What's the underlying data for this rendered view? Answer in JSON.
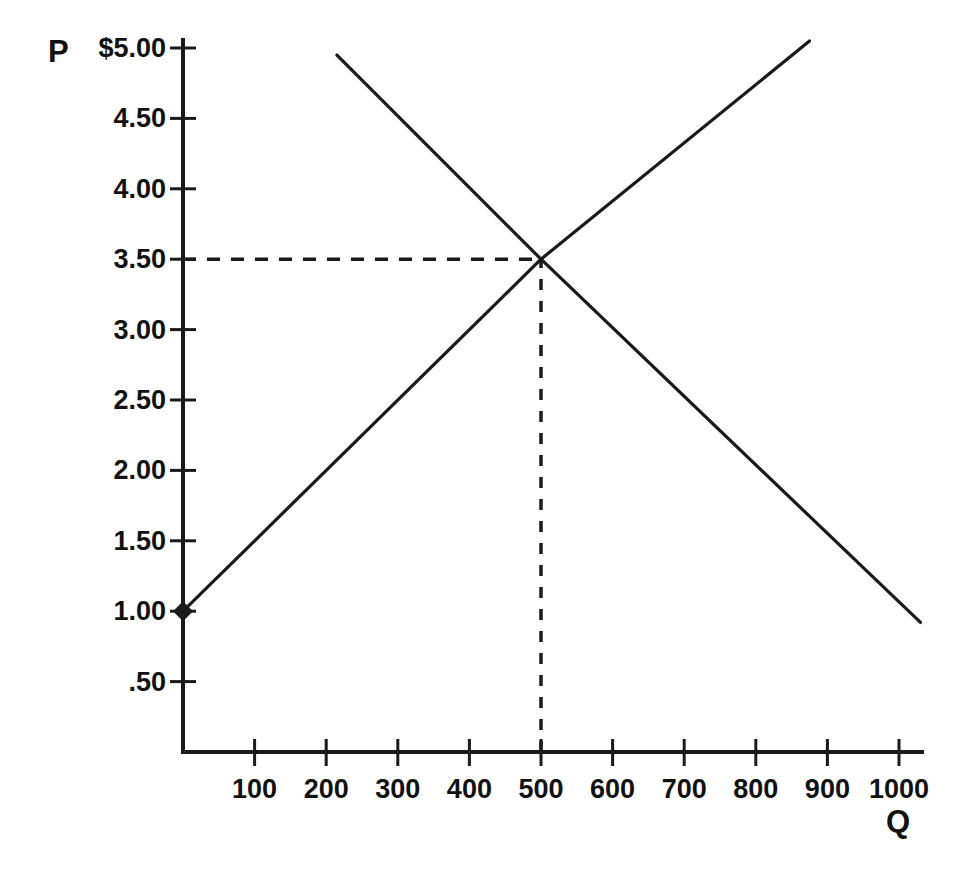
{
  "chart_data": {
    "type": "line",
    "title": "",
    "subtitle": "",
    "xlabel": "Q",
    "ylabel": "P",
    "xlim": [
      0,
      1030
    ],
    "ylim": [
      0,
      5.15
    ],
    "grid": false,
    "legend": "none",
    "x_tick_values": [
      100,
      200,
      300,
      400,
      500,
      600,
      700,
      800,
      900,
      1000
    ],
    "x_tick_labels": [
      "100",
      "200",
      "300",
      "400",
      "500",
      "600",
      "700",
      "800",
      "900",
      "1000"
    ],
    "y_tick_values": [
      0.5,
      1.0,
      1.5,
      2.0,
      2.5,
      3.0,
      3.5,
      4.0,
      4.5,
      5.0
    ],
    "y_tick_labels": [
      ".50",
      "1.00",
      "1.50",
      "2.00",
      "2.50",
      "3.00",
      "3.50",
      "4.00",
      "4.50",
      "$5.00"
    ],
    "series": [
      {
        "name": "supply",
        "points": [
          [
            0,
            1.0
          ],
          [
            500,
            3.5
          ],
          [
            875,
            5.05
          ]
        ],
        "style": "solid",
        "color": "#1a1a1a",
        "marker_points": [
          [
            0,
            1.0
          ]
        ],
        "marker": "diamond"
      },
      {
        "name": "demand",
        "points": [
          [
            215,
            4.95
          ],
          [
            500,
            3.5
          ],
          [
            1030,
            0.92
          ]
        ],
        "style": "solid",
        "color": "#1a1a1a",
        "marker_points": [],
        "marker": "none"
      }
    ],
    "annotations": [
      {
        "name": "equilibrium-price-guide",
        "type": "dashed-horizontal",
        "from": [
          0,
          3.5
        ],
        "to": [
          500,
          3.5
        ],
        "color": "#1a1a1a"
      },
      {
        "name": "equilibrium-quantity-guide",
        "type": "dashed-vertical",
        "from": [
          500,
          0
        ],
        "to": [
          500,
          3.5
        ],
        "color": "#1a1a1a"
      }
    ],
    "equilibrium": {
      "price": 3.5,
      "quantity": 500
    }
  },
  "axes": {
    "price_axis_name": "P",
    "quantity_axis_name": "Q"
  },
  "colors": {
    "background": "#ffffff",
    "ink": "#1a1a1a",
    "text": "#111111"
  }
}
